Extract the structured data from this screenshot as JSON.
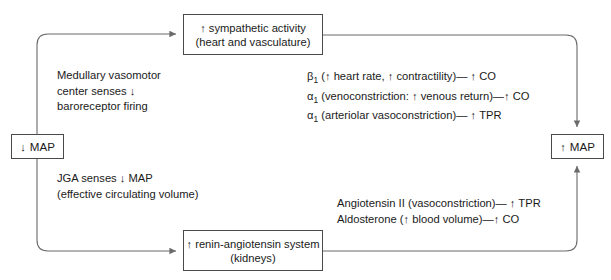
{
  "diagram": {
    "line_color": "#6b6b6b",
    "box_border_color": "#4a4a4a",
    "text_color": "#1a1a1a"
  },
  "nodes": {
    "map_low": {
      "arrow": "↓",
      "label": "MAP"
    },
    "map_high": {
      "arrow": "↑",
      "label": "MAP"
    },
    "sympathetic": {
      "line1": "↑ sympathetic activity",
      "line2": "(heart and vasculature)"
    },
    "renin": {
      "line1": "↑ renin-angiotensin system",
      "line2": "(kidneys)"
    }
  },
  "annotations": {
    "medullary": {
      "line1": "Medullary vasomotor",
      "line2": "center senses ↓",
      "line3": "baroreceptor firing"
    },
    "jga": {
      "line1": "JGA senses ↓ MAP",
      "line2": "(effective circulating volume)"
    },
    "sympathetic_effects": {
      "line1_receptor": "β",
      "line1_sub": "1",
      "line1_rest": " (↑ heart rate, ↑ contractility)— ↑ CO",
      "line2_receptor": "α",
      "line2_sub": "1",
      "line2_rest": " (venoconstriction: ↑ venous return)—↑ CO",
      "line3_receptor": "α",
      "line3_sub": "1",
      "line3_rest": " (arteriolar vasoconstriction)— ↑ TPR"
    },
    "raas_effects": {
      "line1": "Angiotensin II (vasoconstriction)— ↑ TPR",
      "line2": "Aldosterone (↑ blood volume)—↑ CO"
    }
  }
}
